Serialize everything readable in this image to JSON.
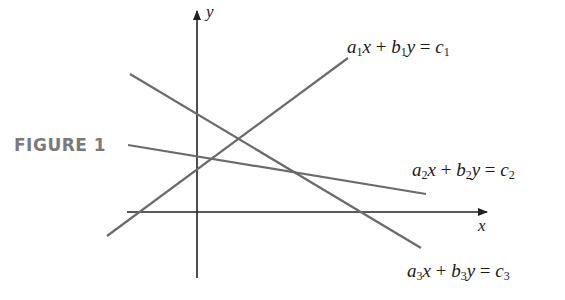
{
  "figure": {
    "label": "FIGURE 1",
    "axes": {
      "x_label": "x",
      "y_label": "y"
    },
    "lines": [
      {
        "id": 1,
        "equation": "a1x + b1y = c1",
        "parts": {
          "a": "a",
          "a_sub": "1",
          "x": "x",
          "plus": "+",
          "b": "b",
          "b_sub": "1",
          "y": "y",
          "eq": "=",
          "c": "c",
          "c_sub": "1"
        },
        "from": [
          107,
          236
        ],
        "to": [
          348,
          58
        ]
      },
      {
        "id": 2,
        "equation": "a2x + b2y = c2",
        "parts": {
          "a": "a",
          "a_sub": "2",
          "x": "x",
          "plus": "+",
          "b": "b",
          "b_sub": "2",
          "y": "y",
          "eq": "=",
          "c": "c",
          "c_sub": "2"
        },
        "from": [
          128,
          145
        ],
        "to": [
          426,
          194
        ]
      },
      {
        "id": 3,
        "equation": "a3x + b3y = c3",
        "parts": {
          "a": "a",
          "a_sub": "3",
          "x": "x",
          "plus": "+",
          "b": "b",
          "b_sub": "3",
          "y": "y",
          "eq": "=",
          "c": "c",
          "c_sub": "3"
        },
        "from": [
          130,
          74
        ],
        "to": [
          421,
          248
        ]
      }
    ],
    "colors": {
      "line": "#6b6b6b",
      "axis": "#222222",
      "label_gray": "#7a7a7a",
      "text": "#1a1a1a"
    }
  }
}
